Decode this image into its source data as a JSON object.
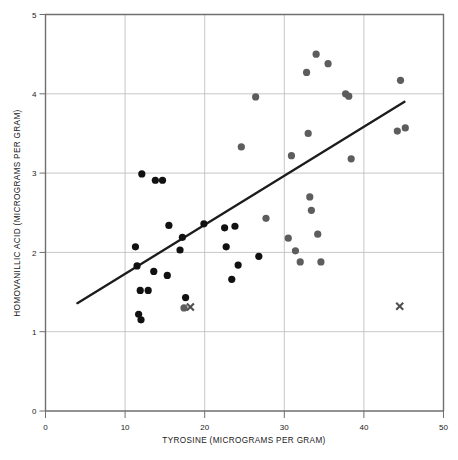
{
  "figure": {
    "background_color": "#ffffff",
    "caption_partial": ""
  },
  "chart_data": {
    "type": "scatter",
    "title": "",
    "subtitle": "",
    "xlabel": "TYROSINE (MICROGRAMS PER GRAM)",
    "ylabel": "HOMOVANILLIC ACID (MICROGRAMS PER GRAM)",
    "xlim": [
      0,
      50
    ],
    "ylim": [
      0,
      5
    ],
    "xticks": [
      0,
      10,
      20,
      30,
      40,
      50
    ],
    "yticks": [
      0,
      1,
      2,
      3,
      4,
      5
    ],
    "xticklabels": [
      "0",
      "10",
      "20",
      "30",
      "40",
      "50"
    ],
    "yticklabels": [
      "0",
      "1",
      "2",
      "3",
      "4",
      "5"
    ],
    "grid": true,
    "grid_axes": "both",
    "legend": null,
    "legend_position": "none",
    "colors": {
      "point_dark": "#111111",
      "point_grey": "#5d5d5d",
      "marker_x": "#4f4f4f",
      "regression_line": "#1c1c1c",
      "grid": "#b9b9b9",
      "frame": "#6f6f6f"
    },
    "series": [
      {
        "name": "dark-points",
        "marker": "circle",
        "color": "#111111",
        "radius": 3.6,
        "points": [
          [
            12.1,
            2.99
          ],
          [
            13.8,
            2.91
          ],
          [
            14.7,
            2.91
          ],
          [
            15.5,
            2.34
          ],
          [
            11.3,
            2.07
          ],
          [
            17.2,
            2.19
          ],
          [
            16.9,
            2.03
          ],
          [
            11.5,
            1.83
          ],
          [
            13.6,
            1.76
          ],
          [
            15.3,
            1.71
          ],
          [
            19.9,
            2.36
          ],
          [
            11.9,
            1.52
          ],
          [
            12.9,
            1.52
          ],
          [
            17.6,
            1.43
          ],
          [
            11.7,
            1.22
          ],
          [
            12.0,
            1.15
          ],
          [
            22.5,
            2.31
          ],
          [
            23.8,
            2.33
          ],
          [
            22.7,
            2.07
          ],
          [
            23.4,
            1.66
          ],
          [
            24.2,
            1.84
          ],
          [
            26.8,
            1.95
          ]
        ]
      },
      {
        "name": "grey-points",
        "marker": "circle",
        "color": "#5d5d5d",
        "radius": 3.6,
        "points": [
          [
            17.4,
            1.3
          ],
          [
            24.6,
            3.33
          ],
          [
            26.4,
            3.96
          ],
          [
            27.7,
            2.43
          ],
          [
            30.5,
            2.18
          ],
          [
            30.9,
            3.22
          ],
          [
            31.4,
            2.02
          ],
          [
            32.0,
            1.88
          ],
          [
            32.8,
            4.27
          ],
          [
            33.0,
            3.5
          ],
          [
            33.2,
            2.7
          ],
          [
            33.4,
            2.53
          ],
          [
            34.0,
            4.5
          ],
          [
            34.2,
            2.23
          ],
          [
            34.6,
            1.88
          ],
          [
            35.5,
            4.38
          ],
          [
            37.7,
            4.0
          ],
          [
            38.1,
            3.97
          ],
          [
            38.4,
            3.18
          ],
          [
            44.6,
            4.17
          ],
          [
            44.2,
            3.53
          ],
          [
            45.2,
            3.57
          ]
        ]
      }
    ],
    "markers_x": {
      "name": "x-markers",
      "marker": "x",
      "color": "#4f4f4f",
      "size": 7,
      "points": [
        [
          18.2,
          1.31
        ],
        [
          44.5,
          1.32
        ]
      ]
    },
    "regression_line": {
      "name": "fit-line",
      "x_start": 4.0,
      "y_start": 1.36,
      "x_end": 45.1,
      "y_end": 3.9,
      "slope": 0.0618,
      "intercept": 1.113
    }
  }
}
